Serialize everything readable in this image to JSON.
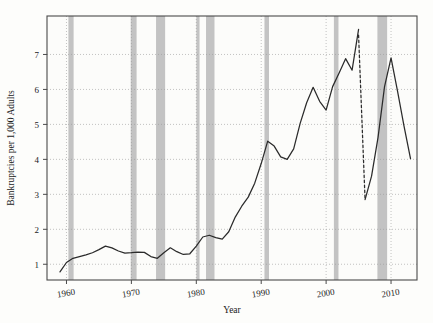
{
  "chart_data": {
    "type": "line",
    "title": "",
    "xlabel": "Year",
    "ylabel": "Bankruptcies per 1,000 Adults",
    "xlim": [
      1957,
      2014
    ],
    "ylim": [
      0.55,
      8.1
    ],
    "xticks": [
      1960,
      1970,
      1980,
      1990,
      2000,
      2010
    ],
    "xticklabels": [
      "1960",
      "1970",
      "1980",
      "1990",
      "2000",
      "2010"
    ],
    "yticks": [
      1,
      2,
      3,
      4,
      5,
      6,
      7
    ],
    "yticklabels": [
      "1",
      "2",
      "3",
      "4",
      "5",
      "6",
      "7"
    ],
    "grid": "dotted-horizontal-and-vertical",
    "legend": "none",
    "series": [
      {
        "name": "Bankruptcies per 1,000 adults",
        "style": "solid",
        "x": [
          1959,
          1960,
          1961,
          1962,
          1963,
          1964,
          1965,
          1966,
          1967,
          1968,
          1969,
          1970,
          1971,
          1972,
          1973,
          1974,
          1975,
          1976,
          1977,
          1978,
          1979,
          1980,
          1981,
          1982,
          1983,
          1984,
          1985,
          1986,
          1987,
          1988,
          1989,
          1990,
          1991,
          1992,
          1993,
          1994,
          1995,
          1996,
          1997,
          1998,
          1999,
          2000,
          2001,
          2002,
          2003,
          2004,
          2005
        ],
        "y": [
          0.78,
          1.05,
          1.17,
          1.22,
          1.27,
          1.33,
          1.42,
          1.52,
          1.47,
          1.38,
          1.32,
          1.33,
          1.35,
          1.34,
          1.22,
          1.17,
          1.33,
          1.47,
          1.36,
          1.28,
          1.3,
          1.52,
          1.78,
          1.83,
          1.76,
          1.72,
          1.93,
          2.35,
          2.66,
          2.92,
          3.32,
          3.88,
          4.52,
          4.38,
          4.07,
          4.0,
          4.3,
          5.03,
          5.62,
          6.06,
          5.66,
          5.41,
          6.08,
          6.47,
          6.88,
          6.55,
          7.72
        ],
        "note": "solid line from 1959 through the 2005 spike"
      },
      {
        "name": "Post-BAPCPA drop (dashed)",
        "style": "dashed",
        "x": [
          2005,
          2006
        ],
        "y": [
          7.55,
          2.85
        ],
        "note": "dashed vertical drop after the 2005 bankruptcy-reform filing surge"
      },
      {
        "name": "Bankruptcies per 1,000 adults (post-2006)",
        "style": "solid",
        "x": [
          2006,
          2007,
          2008,
          2009,
          2010,
          2011,
          2012,
          2013
        ],
        "y": [
          2.85,
          3.52,
          4.63,
          6.08,
          6.9,
          5.95,
          4.95,
          4.02
        ],
        "note": "solid line resuming after the 2006 trough"
      }
    ],
    "recession_bands": [
      {
        "label": "1960-61",
        "start": 1960.3,
        "end": 1961.1
      },
      {
        "label": "1969-70",
        "start": 1969.9,
        "end": 1970.8
      },
      {
        "label": "1973-75",
        "start": 1973.8,
        "end": 1975.2
      },
      {
        "label": "1980",
        "start": 1980.0,
        "end": 1980.5
      },
      {
        "label": "1981-82",
        "start": 1981.5,
        "end": 1982.8
      },
      {
        "label": "1990-91",
        "start": 1990.5,
        "end": 1991.2
      },
      {
        "label": "2001",
        "start": 2001.2,
        "end": 2001.9
      },
      {
        "label": "2007-09",
        "start": 2007.9,
        "end": 2009.4
      }
    ],
    "colors": {
      "line": "#2b2b2b",
      "recession_band": "#b0b0b0",
      "grid": "#9a9a9a",
      "frame": "#4a4a4a",
      "background": "#fdfdfb",
      "plot_background": "#fcfcfa"
    }
  }
}
